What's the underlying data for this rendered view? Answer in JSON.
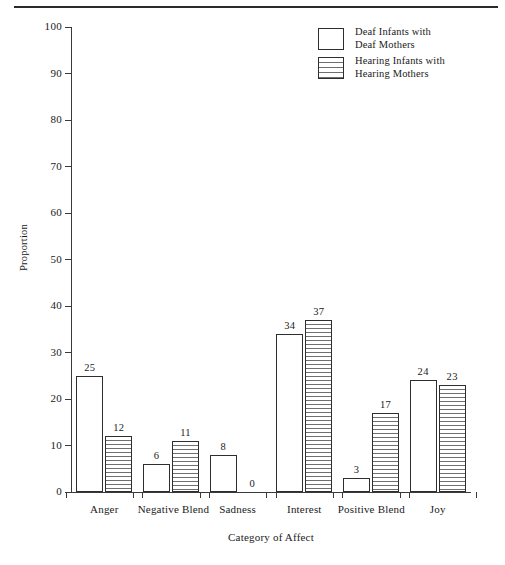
{
  "chart_data": {
    "type": "bar",
    "title": "",
    "subtitle": "",
    "xlabel": "Category of Affect",
    "ylabel": "Proportion",
    "ylim": [
      0,
      100
    ],
    "yticks": [
      0,
      10,
      20,
      30,
      40,
      50,
      60,
      70,
      80,
      90,
      100
    ],
    "grid": false,
    "legend_position": "top-right",
    "categories": [
      "Anger",
      "Negative Blend",
      "Sadness",
      "Interest",
      "Positive Blend",
      "Joy"
    ],
    "series": [
      {
        "name": "Deaf Infants with Deaf Mothers",
        "name_line1": "Deaf Infants with",
        "name_line2": "Deaf Mothers",
        "fill": "open",
        "values": [
          25,
          6,
          8,
          34,
          3,
          24
        ]
      },
      {
        "name": "Hearing Infants with Hearing Mothers",
        "name_line1": "Hearing Infants with",
        "name_line2": "Hearing Mothers",
        "fill": "horizontal-hatch",
        "values": [
          12,
          11,
          0,
          37,
          17,
          23
        ]
      }
    ]
  },
  "colors": {
    "ink": "#2e2e2e",
    "axis": "#3a3a3a",
    "hatch": "#6f6f6f",
    "background": "#ffffff"
  }
}
